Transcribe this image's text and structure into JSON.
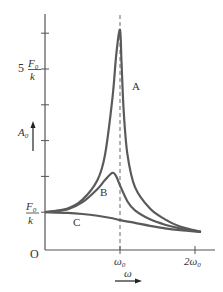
{
  "chart_data": {
    "type": "line",
    "title": "",
    "xlabel": "ω",
    "ylabel": "A0",
    "x_ticks": [
      {
        "value": 1,
        "label": "ω0"
      },
      {
        "value": 2,
        "label": "2ω0"
      }
    ],
    "y_ticks": [
      1,
      2,
      3,
      4,
      5,
      6
    ],
    "y_tick_labels": [
      {
        "value": 1,
        "coef": "",
        "num": "F0",
        "den": "k"
      },
      {
        "value": 5,
        "coef": "5",
        "num": "F0",
        "den": "k"
      }
    ],
    "origin_label": "O",
    "xlim": [
      0,
      2.15
    ],
    "ylim": [
      0,
      6.3
    ],
    "resonance_line_x": 1,
    "grid": false,
    "legend": "inline",
    "series": [
      {
        "name": "A",
        "x": [
          0,
          0.3,
          0.5,
          0.7,
          0.8,
          0.9,
          0.95,
          1.0,
          1.02,
          1.05,
          1.1,
          1.2,
          1.4,
          1.6,
          1.8,
          2.08
        ],
        "y": [
          1.0,
          1.1,
          1.35,
          1.9,
          2.6,
          4.2,
          5.4,
          6.1,
          5.2,
          3.8,
          2.6,
          1.7,
          1.1,
          0.8,
          0.6,
          0.45
        ]
      },
      {
        "name": "B",
        "x": [
          0,
          0.3,
          0.5,
          0.7,
          0.8,
          0.9,
          0.95,
          1.0,
          1.1,
          1.2,
          1.4,
          1.6,
          1.8,
          2.08
        ],
        "y": [
          1.0,
          1.08,
          1.28,
          1.65,
          1.9,
          2.1,
          2.0,
          1.75,
          1.3,
          1.05,
          0.8,
          0.65,
          0.55,
          0.45
        ]
      },
      {
        "name": "C",
        "x": [
          0,
          0.3,
          0.5,
          0.7,
          0.9,
          1.0,
          1.2,
          1.4,
          1.6,
          1.8,
          2.08
        ],
        "y": [
          1.0,
          0.98,
          0.95,
          0.9,
          0.83,
          0.78,
          0.7,
          0.62,
          0.55,
          0.5,
          0.45
        ]
      }
    ]
  },
  "labels": {
    "origin": "O",
    "omega0": "ω",
    "omega0_sub": "0",
    "two_omega0": "2ω",
    "two_omega0_sub": "0",
    "x_axis": "ω",
    "y_axis": "A",
    "y_axis_sub": "0",
    "five": "5",
    "F": "F",
    "F_sub": "0",
    "k": "k",
    "curve_a": "A",
    "curve_b": "B",
    "curve_c": "C"
  },
  "colors": {
    "curve": "#5a5a5a",
    "axis": "#555555",
    "text": "#333333"
  }
}
